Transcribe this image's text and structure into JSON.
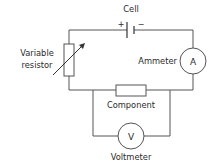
{
  "diagram": {
    "type": "circuit",
    "labels": {
      "cell": "Cell",
      "cell_plus": "+",
      "cell_minus": "−",
      "variable_resistor_line1": "Variable",
      "variable_resistor_line2": "resistor",
      "ammeter": "Ammeter",
      "ammeter_symbol": "A",
      "component": "Component",
      "voltmeter": "Voltmeter",
      "voltmeter_symbol": "V"
    },
    "colors": {
      "line": "#555555",
      "text": "#2a2a2a"
    }
  }
}
